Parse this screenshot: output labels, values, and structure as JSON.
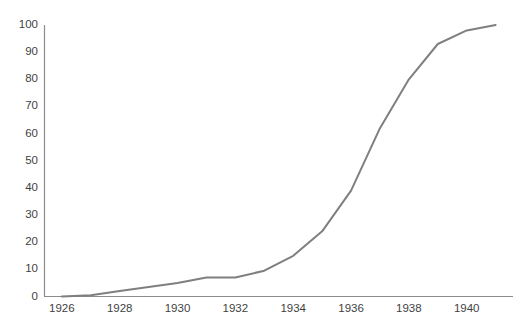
{
  "chart_data": {
    "type": "line",
    "title": "",
    "xlabel": "",
    "ylabel": "",
    "x": [
      1926,
      1927,
      1928,
      1929,
      1930,
      1931,
      1932,
      1933,
      1934,
      1935,
      1936,
      1937,
      1938,
      1939,
      1940,
      1941
    ],
    "values": [
      0,
      0.5,
      2,
      3.5,
      5,
      7,
      7,
      9.5,
      15,
      24,
      39,
      62,
      80,
      93,
      98,
      100
    ],
    "series": [
      {
        "name": "",
        "values": [
          0,
          0.5,
          2,
          3.5,
          5,
          7,
          7,
          9.5,
          15,
          24,
          39,
          62,
          80,
          93,
          98,
          100
        ]
      }
    ],
    "xlim": [
      1925.4,
      1941.6
    ],
    "ylim": [
      0,
      100
    ],
    "xticks": [
      1926,
      1928,
      1930,
      1932,
      1934,
      1936,
      1938,
      1940
    ],
    "xtick_labels": [
      "1926",
      "1928",
      "1930",
      "1932",
      "1934",
      "1936",
      "1938",
      "1940"
    ],
    "yticks": [
      0,
      10,
      20,
      30,
      40,
      50,
      60,
      70,
      80,
      90,
      100
    ],
    "ytick_labels": [
      "0",
      "10",
      "20",
      "30",
      "40",
      "50",
      "60",
      "70",
      "80",
      "90",
      "100"
    ],
    "grid": false,
    "legend": false,
    "legend_position": "none",
    "line_color": "#7f7f7f",
    "line_width": 2,
    "axis_color": "#808080"
  },
  "axes": {
    "y_labels": [
      "100",
      "90",
      "80",
      "70",
      "60",
      "50",
      "40",
      "30",
      "20",
      "10",
      "0"
    ],
    "x_labels": [
      "1926",
      "1928",
      "1930",
      "1932",
      "1934",
      "1936",
      "1938",
      "1940"
    ]
  },
  "header": {
    "clipped_title": "chart title"
  }
}
